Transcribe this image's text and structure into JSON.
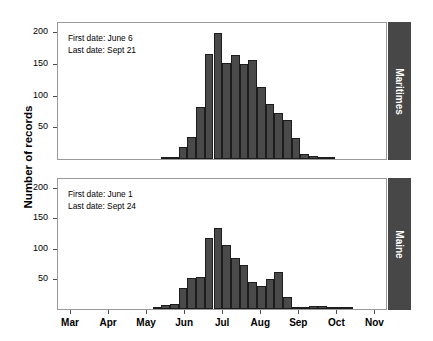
{
  "figure": {
    "ylabel": "Number of records",
    "panels": [
      {
        "strip_label": "Maritimes",
        "first_date_text": "First date: June 6",
        "last_date_text": "Last date: Sept 21"
      },
      {
        "strip_label": "Maine",
        "first_date_text": "First date: June 1",
        "last_date_text": "Last date: Sept 24"
      }
    ],
    "colors": {
      "bar_fill": "#4a4a4a",
      "bar_stroke": "#1d1d1d",
      "strip_fill": "#474747",
      "strip_text": "#ffffff",
      "frame": "#9a9a9a"
    }
  },
  "chart_data": [
    {
      "type": "bar",
      "title": "Maritimes",
      "xlabel": "",
      "ylabel": "Number of records",
      "ylim": [
        0,
        215
      ],
      "yticks": [
        50,
        100,
        150,
        200
      ],
      "ytick_labels": [
        "50",
        "100",
        "150",
        "200"
      ],
      "xtick_labels": [
        "Mar",
        "Apr",
        "May",
        "Jun",
        "Jul",
        "Aug",
        "Sep",
        "Oct",
        "Nov"
      ],
      "xtick_months": [
        3,
        4,
        5,
        6,
        7,
        8,
        9,
        10,
        11
      ],
      "grid": false,
      "legend": "none",
      "annotations": [
        "First date: June 6",
        "Last date: Sept 21"
      ],
      "bin": "week",
      "x": [
        20,
        21,
        22,
        23,
        24,
        25,
        26,
        27,
        28,
        29,
        30,
        31,
        32,
        33,
        34,
        35,
        36,
        37,
        38,
        39
      ],
      "values": [
        1,
        2,
        19,
        35,
        82,
        166,
        200,
        151,
        165,
        150,
        156,
        114,
        87,
        73,
        62,
        33,
        8,
        4,
        2,
        1
      ]
    },
    {
      "type": "bar",
      "title": "Maine",
      "xlabel": "",
      "ylabel": "Number of records",
      "ylim": [
        0,
        215
      ],
      "yticks": [
        50,
        100,
        150,
        200
      ],
      "ytick_labels": [
        "50",
        "100",
        "150",
        "200"
      ],
      "xtick_labels": [
        "Mar",
        "Apr",
        "May",
        "Jun",
        "Jul",
        "Aug",
        "Sep",
        "Oct",
        "Nov"
      ],
      "xtick_months": [
        3,
        4,
        5,
        6,
        7,
        8,
        9,
        10,
        11
      ],
      "grid": false,
      "legend": "none",
      "annotations": [
        "First date: June 1",
        "Last date: Sept 24"
      ],
      "bin": "week",
      "x": [
        19,
        20,
        21,
        22,
        23,
        24,
        25,
        26,
        27,
        28,
        29,
        30,
        31,
        32,
        33,
        34,
        35,
        36,
        37,
        38,
        39,
        40,
        41
      ],
      "values": [
        2,
        6,
        9,
        34,
        51,
        53,
        117,
        134,
        106,
        84,
        73,
        44,
        38,
        49,
        61,
        20,
        4,
        3,
        5,
        5,
        2,
        1,
        1
      ]
    }
  ]
}
